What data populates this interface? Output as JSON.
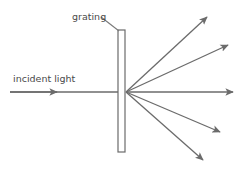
{
  "figure": {
    "background_color": "#ffffff",
    "stroke_color": "#6b6b6b",
    "text_color": "#4a4a4a",
    "width": 245,
    "height": 175
  },
  "labels": {
    "grating": "grating",
    "incident_light": "incident light"
  },
  "diagram_data": {
    "type": "ray-diagram",
    "grating": {
      "shape": "rectangle",
      "x": 118,
      "y": 30,
      "width": 7,
      "height": 122,
      "fill": "#ffffff",
      "stroke": "#6b6b6b"
    },
    "convergence_point": {
      "x": 126,
      "y": 92
    },
    "incident_ray": {
      "label": "incident light",
      "from": {
        "x": 10,
        "y": 92
      },
      "to": {
        "x": 118,
        "y": 92
      },
      "arrowhead_at": {
        "x": 57,
        "y": 92
      },
      "direction": "rightward"
    },
    "diffracted_rays": [
      {
        "order": "+2",
        "to": {
          "x": 207,
          "y": 17
        },
        "angle_deg": 43.4
      },
      {
        "order": "+1",
        "to": {
          "x": 228,
          "y": 45
        },
        "angle_deg": 24.7
      },
      {
        "order": "0",
        "to": {
          "x": 233,
          "y": 92
        },
        "angle_deg": 0
      },
      {
        "order": "-1",
        "to": {
          "x": 220,
          "y": 132
        },
        "angle_deg": -23.0
      },
      {
        "order": "-2",
        "to": {
          "x": 203,
          "y": 160
        },
        "angle_deg": -44.1
      }
    ],
    "leader_line": {
      "label": "grating",
      "from": {
        "x": 101,
        "y": 17
      },
      "to": {
        "x": 119,
        "y": 31
      }
    },
    "label_positions": {
      "grating": {
        "x": 72,
        "y": 20
      },
      "incident_light": {
        "x": 13,
        "y": 82
      }
    }
  }
}
